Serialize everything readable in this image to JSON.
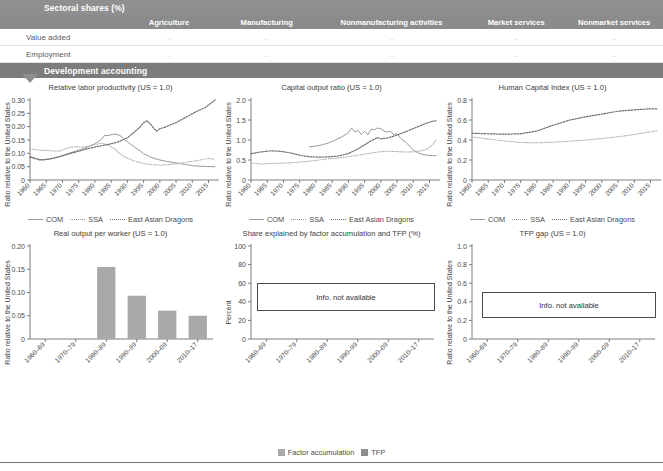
{
  "sectoral": {
    "band_title": "Sectoral shares (%)",
    "columns": [
      "Agriculture",
      "Manufacturing",
      "Nonmanufacturing activities",
      "Market services",
      "Nonmarket services"
    ],
    "rows": [
      {
        "label": "Value added",
        "values": [
          "..",
          "..",
          "..",
          "..",
          ".."
        ]
      },
      {
        "label": "Employment",
        "values": [
          "..",
          "..",
          "..",
          "..",
          ".."
        ]
      }
    ]
  },
  "development": {
    "band_title": "Development accounting"
  },
  "legend_lines": {
    "com": "COM",
    "ssa": "SSA",
    "dragons": "East Asian Dragons"
  },
  "legend_bars": {
    "factor": "Factor accumulation",
    "tfp": "TFP"
  },
  "notices": {
    "not_available": "Info. not available"
  },
  "colors": {
    "band": "#8f8f8f",
    "subhead": "#8b8b8b",
    "line_solid": "#9a9a9a",
    "line_ssa": "#a8a8a8",
    "line_dragons": "#6f6f6f",
    "bar": "#a9a9a9",
    "axis": "#6f6f6f",
    "muted_text": "#c9c9c9"
  },
  "chart_data": [
    {
      "type": "line",
      "title": "Relative labor productivity (US = 1.0)",
      "ylabel": "Ratio relative to the United States",
      "xlabel": "",
      "ylim": [
        0,
        0.3
      ],
      "yticks": [
        "0",
        "0.05",
        "0.10",
        "0.15",
        "0.20",
        "0.25",
        "0.30"
      ],
      "xticks": [
        "1960",
        "1965",
        "1970",
        "1975",
        "1980",
        "1985",
        "1990",
        "1995",
        "2000",
        "2005",
        "2010",
        "2015"
      ],
      "xlim": [
        1960,
        2017
      ],
      "grid": false,
      "legend_position": "bottom",
      "series": [
        {
          "name": "COM",
          "style": "solid",
          "x": [
            1960,
            1962,
            1964,
            1966,
            1968,
            1970,
            1972,
            1974,
            1976,
            1978,
            1980,
            1982,
            1983,
            1984,
            1985,
            1986,
            1987,
            1988,
            1989,
            1990,
            1992,
            1994,
            1995,
            1996,
            1997,
            1998,
            2000,
            2002,
            2004,
            2006,
            2008,
            2010,
            2012,
            2014,
            2016,
            2017
          ],
          "values": [
            0.088,
            0.08,
            0.075,
            0.078,
            0.083,
            0.092,
            0.1,
            0.108,
            0.115,
            0.125,
            0.136,
            0.152,
            0.168,
            0.166,
            0.17,
            0.172,
            0.17,
            0.165,
            0.152,
            0.143,
            0.125,
            0.108,
            0.098,
            0.094,
            0.087,
            0.082,
            0.075,
            0.07,
            0.066,
            0.062,
            0.058,
            0.054,
            0.052,
            0.051,
            0.05,
            0.05
          ]
        },
        {
          "name": "SSA",
          "style": "dotted-light",
          "x": [
            1960,
            1963,
            1966,
            1969,
            1972,
            1974,
            1976,
            1978,
            1980,
            1982,
            1984,
            1986,
            1988,
            1990,
            1992,
            1994,
            1996,
            1998,
            2000,
            2003,
            2006,
            2009,
            2012,
            2015,
            2017
          ],
          "values": [
            0.116,
            0.112,
            0.11,
            0.108,
            0.122,
            0.125,
            0.123,
            0.127,
            0.133,
            0.138,
            0.132,
            0.118,
            0.095,
            0.082,
            0.072,
            0.065,
            0.06,
            0.057,
            0.056,
            0.058,
            0.062,
            0.068,
            0.074,
            0.081,
            0.077
          ]
        },
        {
          "name": "East Asian Dragons",
          "style": "dotted-dark",
          "x": [
            1960,
            1963,
            1966,
            1969,
            1972,
            1975,
            1978,
            1981,
            1984,
            1987,
            1990,
            1992,
            1994,
            1995,
            1996,
            1997,
            1998,
            1999,
            2000,
            2002,
            2005,
            2008,
            2011,
            2014,
            2016,
            2017
          ],
          "values": [
            0.086,
            0.075,
            0.079,
            0.087,
            0.098,
            0.108,
            0.118,
            0.126,
            0.133,
            0.142,
            0.158,
            0.178,
            0.2,
            0.215,
            0.222,
            0.212,
            0.196,
            0.183,
            0.192,
            0.2,
            0.215,
            0.235,
            0.255,
            0.272,
            0.29,
            0.3
          ]
        }
      ]
    },
    {
      "type": "line",
      "title": "Capital output ratio (US = 1.0)",
      "ylabel": "Ratio relative to the United States",
      "xlabel": "",
      "ylim": [
        0,
        2.0
      ],
      "yticks": [
        "0",
        "0.5",
        "1.0",
        "1.5",
        "2.0"
      ],
      "xticks": [
        "1960",
        "1965",
        "1970",
        "1975",
        "1980",
        "1985",
        "1990",
        "1995",
        "2000",
        "2005",
        "2010",
        "2015"
      ],
      "xlim": [
        1960,
        2017
      ],
      "grid": false,
      "legend_position": "bottom",
      "series": [
        {
          "name": "COM",
          "style": "solid",
          "x": [
            1978,
            1980,
            1982,
            1984,
            1986,
            1988,
            1990,
            1991,
            1992,
            1993,
            1994,
            1995,
            1996,
            1997,
            1998,
            1999,
            2000,
            2001,
            2002,
            2003,
            2004,
            2005,
            2006,
            2008,
            2010,
            2012,
            2014,
            2016,
            2017
          ],
          "values": [
            0.83,
            0.85,
            0.88,
            0.93,
            1.0,
            1.08,
            1.18,
            1.3,
            1.2,
            1.24,
            1.14,
            1.22,
            1.13,
            1.27,
            1.26,
            1.3,
            1.28,
            1.22,
            1.2,
            1.22,
            1.13,
            1.16,
            1.05,
            0.92,
            0.75,
            0.66,
            0.62,
            0.61,
            0.61
          ]
        },
        {
          "name": "SSA",
          "style": "dotted-light",
          "x": [
            1960,
            1963,
            1966,
            1969,
            1972,
            1975,
            1978,
            1981,
            1984,
            1987,
            1990,
            1993,
            1996,
            1999,
            2002,
            2005,
            2008,
            2011,
            2014,
            2016,
            2017
          ],
          "values": [
            0.43,
            0.4,
            0.41,
            0.42,
            0.43,
            0.45,
            0.47,
            0.5,
            0.53,
            0.55,
            0.58,
            0.62,
            0.66,
            0.7,
            0.72,
            0.71,
            0.7,
            0.71,
            0.76,
            0.88,
            1.0
          ]
        },
        {
          "name": "East Asian Dragons",
          "style": "dotted-dark",
          "x": [
            1960,
            1963,
            1966,
            1969,
            1972,
            1975,
            1978,
            1981,
            1984,
            1987,
            1990,
            1993,
            1995,
            1997,
            1998,
            1999,
            2000,
            2002,
            2005,
            2008,
            2011,
            2014,
            2016,
            2017
          ],
          "values": [
            0.66,
            0.7,
            0.73,
            0.72,
            0.68,
            0.62,
            0.58,
            0.57,
            0.58,
            0.6,
            0.66,
            0.78,
            0.88,
            0.98,
            1.02,
            1.06,
            1.03,
            1.05,
            1.12,
            1.22,
            1.32,
            1.42,
            1.47,
            1.48
          ]
        }
      ]
    },
    {
      "type": "line",
      "title": "Human Capital Index (US = 1.0)",
      "ylabel": "Ratio relative to the United States",
      "xlabel": "",
      "ylim": [
        0,
        0.8
      ],
      "yticks": [
        "0",
        "0.2",
        "0.4",
        "0.6",
        "0.8"
      ],
      "xticks": [
        "1960",
        "1965",
        "1970",
        "1975",
        "1980",
        "1985",
        "1990",
        "1995",
        "2000",
        "2005",
        "2010",
        "2015"
      ],
      "xlim": [
        1960,
        2017
      ],
      "grid": false,
      "legend_position": "bottom",
      "series": [
        {
          "name": "SSA",
          "style": "dotted-light",
          "x": [
            1960,
            1965,
            1970,
            1975,
            1980,
            1985,
            1990,
            1995,
            2000,
            2005,
            2010,
            2015,
            2017
          ],
          "values": [
            0.43,
            0.41,
            0.39,
            0.375,
            0.372,
            0.378,
            0.388,
            0.4,
            0.415,
            0.432,
            0.455,
            0.482,
            0.492
          ]
        },
        {
          "name": "East Asian Dragons",
          "style": "dotted-dark",
          "x": [
            1960,
            1965,
            1970,
            1975,
            1980,
            1985,
            1990,
            1995,
            2000,
            2005,
            2010,
            2015,
            2017
          ],
          "values": [
            0.468,
            0.462,
            0.458,
            0.462,
            0.49,
            0.548,
            0.598,
            0.632,
            0.66,
            0.688,
            0.702,
            0.712,
            0.712
          ]
        }
      ]
    },
    {
      "type": "bar",
      "title": "Real output per worker (US = 1.0)",
      "ylabel": "Ratio relative to the United States",
      "xlabel": "",
      "ylim": [
        0,
        0.2
      ],
      "yticks": [
        "0",
        "0.05",
        "0.10",
        "0.15",
        "0.20"
      ],
      "categories": [
        "1960–69",
        "1970–79",
        "1980–89",
        "1990–99",
        "2000–09",
        "2010–17"
      ],
      "values": [
        0,
        0,
        0.155,
        0.093,
        0.061,
        0.05
      ],
      "grid": false
    },
    {
      "type": "bar",
      "title": "Share explained by factor accumulation and TFP (%)",
      "ylabel": "Percent",
      "xlabel": "",
      "ylim": [
        0,
        100
      ],
      "yticks": [
        "0",
        "20",
        "40",
        "60",
        "80",
        "100"
      ],
      "categories": [
        "1960–69",
        "1970–79",
        "1980–89",
        "1990–99",
        "2000–09",
        "2010–17"
      ],
      "values": [],
      "annotation": "Info. not available",
      "grid": false,
      "legend_position": "bottom"
    },
    {
      "type": "bar",
      "title": "TFP gap (US = 1.0)",
      "ylabel": "Ratio relative to the United States",
      "xlabel": "",
      "ylim": [
        0,
        1.0
      ],
      "yticks": [
        "0",
        "0.2",
        "0.4",
        "0.6",
        "0.8",
        "1.0"
      ],
      "categories": [
        "1960–69",
        "1970–79",
        "1980–89",
        "1990–99",
        "2000–09",
        "2010–17"
      ],
      "values": [],
      "annotation": "Info. not available",
      "grid": false
    }
  ]
}
